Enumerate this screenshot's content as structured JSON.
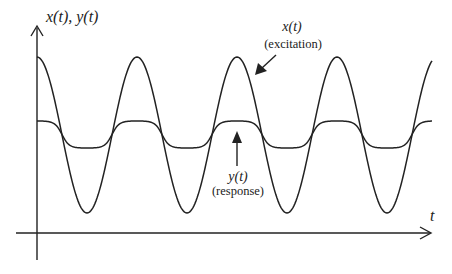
{
  "chart_data": {
    "type": "line",
    "title": "",
    "xlabel": "t",
    "ylabel": "x(t), y(t)",
    "grid": false,
    "legend": "none (inline annotations)",
    "series": [
      {
        "name": "x(t)",
        "description": "excitation",
        "shape": "sinusoid",
        "cycles_visible": 4,
        "peak_relative": 1.0,
        "trough_relative": -1.0,
        "peaks_at_t_fraction": [
          0.0,
          0.25,
          0.5,
          0.75
        ],
        "troughs_at_t_fraction": [
          0.125,
          0.375,
          0.625,
          0.875
        ]
      },
      {
        "name": "y(t)",
        "description": "response",
        "shape": "flattened (clipped) sinusoid, in phase with x(t)",
        "cycles_visible": 4,
        "peak_relative": 0.18,
        "trough_relative": -0.17
      }
    ],
    "annotations": [
      {
        "text": "x(t)",
        "subtext": "(excitation)",
        "arrow_to": "x(t) curve"
      },
      {
        "text": "y(t)",
        "subtext": "(response)",
        "arrow_to": "y(t) curve"
      }
    ]
  },
  "axes": {
    "y_label": "x(t), y(t)",
    "x_label": "t"
  },
  "annotations": {
    "excitation_symbol": "x(t)",
    "excitation_text": "(excitation)",
    "response_symbol": "y(t)",
    "response_text": "(response)"
  },
  "colors": {
    "line": "#222222",
    "background": "#ffffff"
  }
}
